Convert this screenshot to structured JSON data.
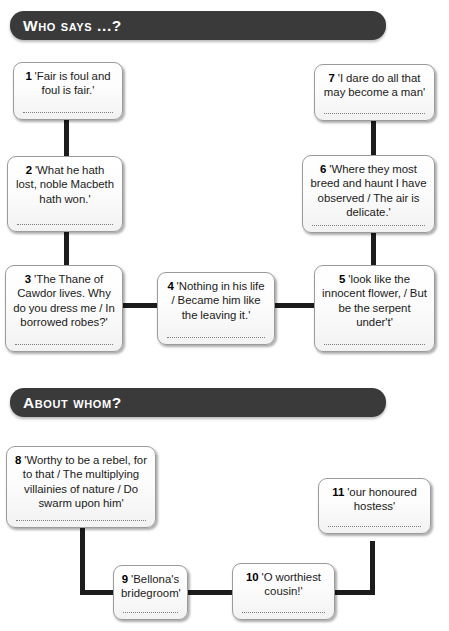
{
  "worksheet": {
    "title": "Who says ...? / About whom?",
    "sections": [
      {
        "id": "who-says",
        "header": "Who says ...?",
        "boxes": [
          {
            "number": "1",
            "quote": "'Fair is foul and foul is fair.'",
            "answer": ""
          },
          {
            "number": "2",
            "quote": "'What he hath lost, noble Macbeth hath won.'",
            "answer": ""
          },
          {
            "number": "3",
            "quote": "'The Thane of Cawdor lives. Why do you dress me / In borrowed robes?'",
            "answer": ""
          },
          {
            "number": "4",
            "quote": "'Nothing in his life / Became him like the leaving it.'",
            "answer": ""
          },
          {
            "number": "5",
            "quote": "'look like the innocent flower, / But be the serpent under't'",
            "answer": ""
          },
          {
            "number": "6",
            "quote": "'Where they most breed and haunt I have observed / The air is delicate.'",
            "answer": ""
          },
          {
            "number": "7",
            "quote": "'I dare do all that may become a man'",
            "answer": ""
          }
        ]
      },
      {
        "id": "about-whom",
        "header": "About whom?",
        "boxes": [
          {
            "number": "8",
            "quote": "'Worthy to be a rebel, for to that / The multiplying villainies of nature / Do swarm upon him'",
            "answer": ""
          },
          {
            "number": "9",
            "quote": "'Bellona's bridegroom'",
            "answer": ""
          },
          {
            "number": "10",
            "quote": "'O worthiest cousin!'",
            "answer": ""
          },
          {
            "number": "11",
            "quote": "'our honoured hostess'",
            "answer": ""
          }
        ]
      }
    ],
    "colors": {
      "header_bar": "#3a3a3a",
      "header_text": "#ffffff",
      "box_border": "#9b9b9b",
      "box_fill": "#fcfcfc",
      "connector": "#1c1c1c",
      "dotted_line": "#7d7d7d"
    }
  }
}
